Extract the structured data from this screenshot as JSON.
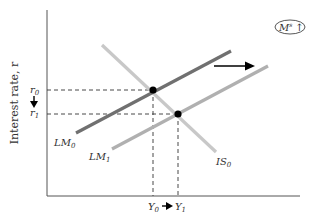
{
  "diagram": {
    "type": "IS-LM",
    "y_axis_label": "Interest rate, r",
    "x_axis_label": "",
    "badge": {
      "text": "M",
      "sup": "s",
      "arrow": "↑"
    },
    "curves": {
      "IS0": {
        "label": "IS",
        "sub": "0",
        "color": "#c4c4c4"
      },
      "LM0": {
        "label": "LM",
        "sub": "0",
        "color": "#6e6e6e"
      },
      "LM1": {
        "label": "LM",
        "sub": "1",
        "color": "#b4b4b4"
      }
    },
    "y_ticks": [
      {
        "label": "r",
        "sub": "0"
      },
      {
        "label": "r",
        "sub": "1"
      }
    ],
    "x_ticks": [
      {
        "label": "Y",
        "sub": "0"
      },
      {
        "label": "Y",
        "sub": "1"
      }
    ],
    "shift_arrow": "LM shifts right",
    "equilibria": [
      {
        "name": "initial",
        "r": "r0",
        "Y": "Y0"
      },
      {
        "name": "new",
        "r": "r1",
        "Y": "Y1"
      }
    ]
  }
}
